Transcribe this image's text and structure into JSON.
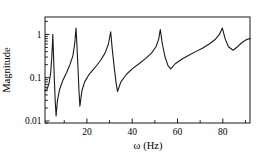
{
  "figure": {
    "background_color": "#ffffff",
    "line_color": "#1a1a1a"
  },
  "chart_data": {
    "type": "line",
    "title": "",
    "xlabel": "ω (Hz)",
    "ylabel": "Magnitude",
    "x_scale": "linear",
    "y_scale": "log",
    "xlim": [
      1.5,
      92
    ],
    "ylim": [
      0.01,
      2.5
    ],
    "grid": false,
    "legend": "none",
    "x_major_ticks": [
      20,
      40,
      60,
      80
    ],
    "x_major_tick_labels": [
      "20",
      "40",
      "60",
      "80"
    ],
    "x_minor_ticks": [
      10,
      30,
      50,
      70,
      90
    ],
    "y_major_ticks": [
      1,
      0.1,
      0.01
    ],
    "y_major_tick_labels": [
      "1",
      "0.1",
      "0.01"
    ],
    "series": [
      {
        "name": "frequency-response-magnitude",
        "color": "#1a1a1a",
        "points": [
          [
            1.5,
            0.05
          ],
          [
            2.5,
            0.055
          ],
          [
            3.3,
            0.075
          ],
          [
            4.0,
            0.13
          ],
          [
            4.5,
            0.3
          ],
          [
            4.8,
            0.65
          ],
          [
            4.95,
            1.0
          ],
          [
            5.2,
            0.4
          ],
          [
            5.6,
            0.1
          ],
          [
            6.0,
            0.03
          ],
          [
            6.4,
            0.013
          ],
          [
            7.0,
            0.03
          ],
          [
            8.0,
            0.055
          ],
          [
            9.5,
            0.09
          ],
          [
            11.0,
            0.13
          ],
          [
            12.5,
            0.2
          ],
          [
            13.8,
            0.32
          ],
          [
            14.6,
            0.6
          ],
          [
            15.2,
            1.4
          ],
          [
            15.6,
            0.55
          ],
          [
            16.1,
            0.15
          ],
          [
            16.5,
            0.05
          ],
          [
            16.9,
            0.022
          ],
          [
            17.8,
            0.05
          ],
          [
            19.0,
            0.08
          ],
          [
            21.0,
            0.12
          ],
          [
            23.5,
            0.17
          ],
          [
            26.0,
            0.25
          ],
          [
            28.0,
            0.37
          ],
          [
            29.5,
            0.6
          ],
          [
            30.5,
            1.15
          ],
          [
            31.2,
            0.45
          ],
          [
            32.2,
            0.15
          ],
          [
            32.9,
            0.075
          ],
          [
            33.5,
            0.048
          ],
          [
            35.0,
            0.08
          ],
          [
            37.5,
            0.12
          ],
          [
            40.0,
            0.16
          ],
          [
            43.0,
            0.21
          ],
          [
            46.0,
            0.28
          ],
          [
            48.5,
            0.37
          ],
          [
            50.5,
            0.52
          ],
          [
            51.7,
            0.78
          ],
          [
            52.4,
            1.3
          ],
          [
            53.3,
            0.6
          ],
          [
            54.5,
            0.3
          ],
          [
            55.8,
            0.19
          ],
          [
            57.0,
            0.16
          ],
          [
            59.0,
            0.21
          ],
          [
            62.0,
            0.27
          ],
          [
            65.0,
            0.33
          ],
          [
            68.0,
            0.4
          ],
          [
            71.0,
            0.48
          ],
          [
            74.0,
            0.6
          ],
          [
            76.5,
            0.75
          ],
          [
            78.5,
            1.0
          ],
          [
            79.8,
            1.4
          ],
          [
            81.0,
            0.8
          ],
          [
            82.5,
            0.52
          ],
          [
            84.5,
            0.43
          ],
          [
            86.5,
            0.52
          ],
          [
            88.5,
            0.65
          ],
          [
            90.5,
            0.76
          ],
          [
            92.0,
            0.8
          ]
        ]
      }
    ],
    "features": {
      "resonance_peaks_hz_mag": [
        [
          4.95,
          1.0
        ],
        [
          15.2,
          1.4
        ],
        [
          30.5,
          1.15
        ],
        [
          52.4,
          1.3
        ],
        [
          79.8,
          1.4
        ]
      ],
      "antiresonance_notches_hz_mag": [
        [
          6.4,
          0.013
        ],
        [
          16.9,
          0.022
        ],
        [
          33.5,
          0.048
        ],
        [
          57.0,
          0.16
        ],
        [
          84.5,
          0.43
        ]
      ]
    }
  }
}
